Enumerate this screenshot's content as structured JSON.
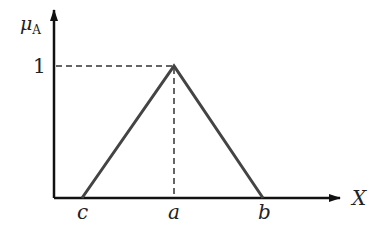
{
  "diagram": {
    "type": "triangular membership function",
    "y_axis": {
      "label": "μ",
      "subscript": "A",
      "tick_label": "1"
    },
    "x_axis": {
      "label": "X"
    },
    "points": {
      "c": "c",
      "a": "a",
      "b": "b"
    },
    "colors": {
      "axis": "#111111",
      "triangle": "#444444",
      "guide": "#333333",
      "text": "#222222"
    }
  }
}
